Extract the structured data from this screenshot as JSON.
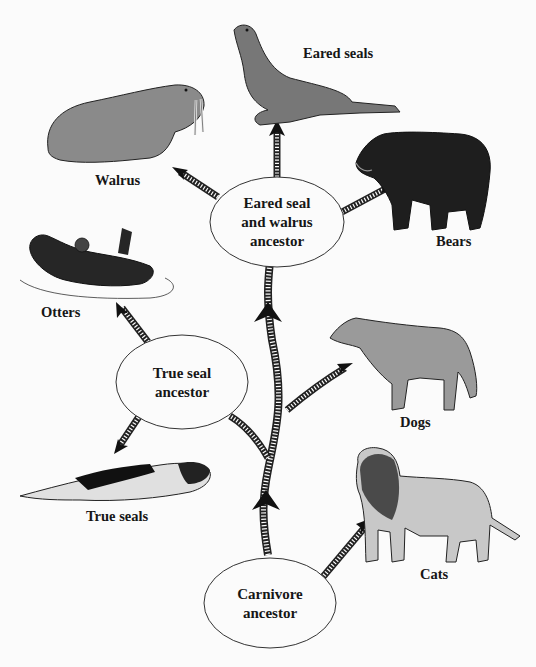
{
  "diagram": {
    "type": "phylogenetic-tree",
    "nodes": [
      {
        "id": "carnivore",
        "label_line1": "Carnivore",
        "label_line2": "ancestor"
      },
      {
        "id": "true-seal",
        "label_line1": "True seal",
        "label_line2": "ancestor"
      },
      {
        "id": "eared-walrus",
        "label_line1": "Eared seal",
        "label_line2": "and walrus",
        "label_line3": "ancestor"
      }
    ],
    "leaves": {
      "walrus": "Walrus",
      "eared_seals": "Eared seals",
      "bears": "Bears",
      "otters": "Otters",
      "dogs": "Dogs",
      "true_seals": "True seals",
      "cats": "Cats"
    },
    "edges": [
      {
        "from": "Carnivore ancestor",
        "to": "Cats"
      },
      {
        "from": "Carnivore ancestor",
        "to": "Dogs"
      },
      {
        "from": "Carnivore ancestor",
        "to": "True seal ancestor"
      },
      {
        "from": "Carnivore ancestor",
        "to": "Eared seal and walrus ancestor"
      },
      {
        "from": "True seal ancestor",
        "to": "Otters"
      },
      {
        "from": "True seal ancestor",
        "to": "True seals"
      },
      {
        "from": "Eared seal and walrus ancestor",
        "to": "Walrus"
      },
      {
        "from": "Eared seal and walrus ancestor",
        "to": "Eared seals"
      },
      {
        "from": "Eared seal and walrus ancestor",
        "to": "Bears"
      }
    ]
  }
}
